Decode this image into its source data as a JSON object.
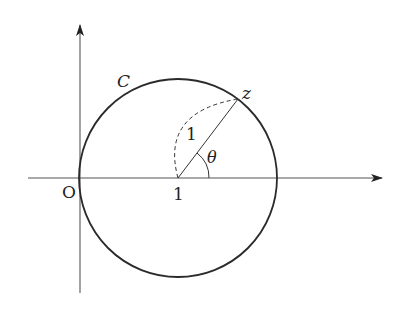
{
  "diagram": {
    "type": "complex-plane-circle",
    "colors": {
      "stroke": "#2a2a2a",
      "axis": "#555555",
      "background": "#ffffff"
    },
    "labels": {
      "origin": "O",
      "curve": "C",
      "point": "z",
      "center": "1",
      "radius": "1",
      "angle": "θ"
    },
    "geometry": {
      "center": [
        178,
        178
      ],
      "radius": 99,
      "point_z": [
        238,
        99
      ],
      "x_axis": {
        "from": [
          28,
          178
        ],
        "to": [
          382,
          178
        ]
      },
      "y_axis": {
        "from": [
          80,
          293
        ],
        "to": [
          80,
          25
        ]
      },
      "angle_arc_radius": 31
    }
  }
}
